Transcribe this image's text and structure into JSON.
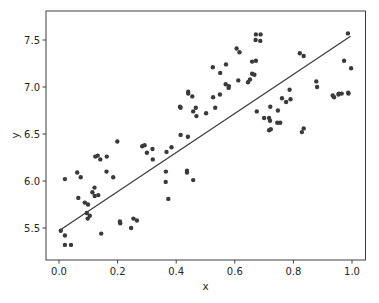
{
  "chart_data": {
    "type": "scatter",
    "title": "",
    "xlabel": "x",
    "ylabel": "y",
    "xlim": [
      -0.045,
      1.045
    ],
    "ylim": [
      5.2,
      7.8
    ],
    "x_ticks": [
      0.0,
      0.2,
      0.4,
      0.6,
      0.8,
      1.0
    ],
    "x_tick_labels": [
      "0.0",
      "0.2",
      "0.4",
      "0.6",
      "0.8",
      "1.0"
    ],
    "y_ticks": [
      5.5,
      6.0,
      6.5,
      7.0,
      7.5
    ],
    "y_tick_labels": [
      "5.5",
      "6.0",
      "6.5",
      "7.0",
      "7.5"
    ],
    "grid": false,
    "legend": null,
    "series": [
      {
        "name": "data",
        "kind": "scatter",
        "color": "#3a3a3a",
        "x": [
          0.006,
          0.02,
          0.02,
          0.02,
          0.041,
          0.062,
          0.074,
          0.066,
          0.088,
          0.099,
          0.098,
          0.095,
          0.105,
          0.114,
          0.121,
          0.122,
          0.134,
          0.144,
          0.124,
          0.132,
          0.141,
          0.163,
          0.162,
          0.185,
          0.208,
          0.209,
          0.246,
          0.199,
          0.254,
          0.266,
          0.284,
          0.3,
          0.292,
          0.32,
          0.319,
          0.364,
          0.373,
          0.365,
          0.367,
          0.384,
          0.413,
          0.415,
          0.441,
          0.441,
          0.44,
          0.415,
          0.455,
          0.469,
          0.458,
          0.467,
          0.437,
          0.437,
          0.458,
          0.502,
          0.525,
          0.526,
          0.533,
          0.549,
          0.57,
          0.55,
          0.579,
          0.58,
          0.569,
          0.606,
          0.612,
          0.616,
          0.645,
          0.652,
          0.659,
          0.667,
          0.659,
          0.672,
          0.687,
          0.671,
          0.688,
          0.672,
          0.717,
          0.72,
          0.7,
          0.717,
          0.723,
          0.745,
          0.787,
          0.775,
          0.761,
          0.79,
          0.822,
          0.835,
          0.878,
          0.881,
          0.955,
          0.965,
          0.987,
          0.988,
          0.934,
          0.939,
          0.954,
          0.973,
          0.986,
          0.997,
          0.721,
          0.747,
          0.755,
          0.829,
          0.835,
          0.675
        ],
        "y": [
          5.47,
          6.02,
          5.42,
          5.32,
          5.32,
          6.09,
          6.04,
          5.82,
          5.77,
          5.75,
          5.6,
          5.66,
          5.63,
          5.88,
          5.93,
          5.84,
          5.85,
          5.44,
          6.26,
          6.27,
          6.23,
          6.26,
          6.1,
          6.04,
          5.57,
          5.55,
          5.5,
          6.42,
          5.6,
          5.58,
          6.37,
          6.3,
          6.38,
          6.23,
          6.34,
          5.99,
          5.81,
          6.1,
          6.31,
          6.36,
          6.79,
          6.78,
          6.93,
          6.95,
          6.47,
          6.49,
          6.9,
          6.69,
          6.74,
          6.78,
          6.11,
          6.09,
          6.01,
          6.72,
          7.21,
          6.89,
          6.78,
          6.92,
          7.24,
          7.15,
          6.99,
          7.01,
          7.03,
          7.41,
          7.07,
          7.37,
          7.05,
          7.08,
          7.14,
          7.13,
          7.27,
          7.28,
          7.49,
          7.5,
          7.56,
          7.56,
          6.67,
          6.64,
          6.67,
          6.54,
          6.55,
          6.62,
          6.97,
          6.84,
          6.88,
          6.87,
          7.36,
          7.33,
          7.06,
          7.0,
          6.93,
          6.93,
          6.94,
          6.93,
          6.91,
          6.89,
          6.92,
          7.28,
          7.57,
          7.2,
          6.79,
          6.75,
          6.62,
          6.52,
          6.56,
          6.74
        ]
      },
      {
        "name": "fit",
        "kind": "line",
        "color": "#3a3a3a",
        "x": [
          0.0,
          0.995
        ],
        "y": [
          5.47,
          7.54
        ]
      }
    ]
  }
}
